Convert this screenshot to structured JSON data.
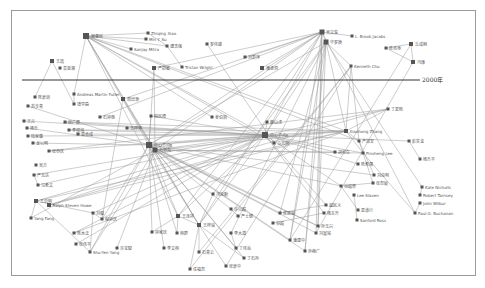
{
  "diagram": {
    "type": "network",
    "timeline_label": "2000年",
    "timeline_y": 80,
    "colors": {
      "node": "#555555",
      "edge": "#9a9a9a",
      "line": "#333333",
      "frame": "#9a9a9a"
    },
    "nodes": [
      {
        "id": "n1",
        "label": "谢惠民",
        "x": 86,
        "y": 36,
        "s": 6
      },
      {
        "id": "n2",
        "label": "Zhiqing Xiao",
        "x": 148,
        "y": 33,
        "s": 3
      },
      {
        "id": "n3",
        "label": "Min Y. Su",
        "x": 146,
        "y": 39,
        "s": 3
      },
      {
        "id": "n4",
        "label": "Sanjay Mitra",
        "x": 131,
        "y": 49,
        "s": 3
      },
      {
        "id": "n5",
        "label": "谭浩强",
        "x": 167,
        "y": 46,
        "s": 3
      },
      {
        "id": "n6",
        "label": "罗伟雄",
        "x": 207,
        "y": 44,
        "s": 3
      },
      {
        "id": "n7",
        "label": "严蔚敏",
        "x": 154,
        "y": 68,
        "s": 4
      },
      {
        "id": "n8",
        "label": "Tristan Wright",
        "x": 182,
        "y": 67,
        "s": 3
      },
      {
        "id": "n9",
        "label": "王选",
        "x": 52,
        "y": 61,
        "s": 4
      },
      {
        "id": "n10",
        "label": "袁亚湘",
        "x": 60,
        "y": 68,
        "s": 3
      },
      {
        "id": "n11",
        "label": "吴文俊",
        "x": 322,
        "y": 32,
        "s": 5
      },
      {
        "id": "n12",
        "label": "L. Brook Jacobs",
        "x": 352,
        "y": 36,
        "s": 3
      },
      {
        "id": "n13",
        "label": "华罗庚",
        "x": 326,
        "y": 42,
        "s": 5
      },
      {
        "id": "n14",
        "label": "刘爱萍",
        "x": 245,
        "y": 57,
        "s": 3
      },
      {
        "id": "n15",
        "label": "潘承洞",
        "x": 262,
        "y": 68,
        "s": 4
      },
      {
        "id": "n16",
        "label": "Kenneth Chu",
        "x": 351,
        "y": 66,
        "s": 3
      },
      {
        "id": "n17",
        "label": "陈省身",
        "x": 386,
        "y": 48,
        "s": 3
      },
      {
        "id": "n18",
        "label": "丘成桐",
        "x": 411,
        "y": 44,
        "s": 4
      },
      {
        "id": "n19",
        "label": "冯康",
        "x": 413,
        "y": 62,
        "s": 4
      },
      {
        "id": "n20",
        "label": "Andreas Martin Fuller",
        "x": 74,
        "y": 94,
        "s": 3
      },
      {
        "id": "n21",
        "label": "陈景润",
        "x": 35,
        "y": 97,
        "s": 3
      },
      {
        "id": "n22",
        "label": "钱学森",
        "x": 74,
        "y": 104,
        "s": 3
      },
      {
        "id": "n23",
        "label": "苏步青",
        "x": 28,
        "y": 106,
        "s": 3
      },
      {
        "id": "n24",
        "label": "周培源",
        "x": 123,
        "y": 99,
        "s": 4
      },
      {
        "id": "n25",
        "label": "王元",
        "x": 24,
        "y": 121,
        "s": 3
      },
      {
        "id": "n26",
        "label": "杨乐",
        "x": 27,
        "y": 128,
        "s": 3
      },
      {
        "id": "n27",
        "label": "张广厚",
        "x": 65,
        "y": 122,
        "s": 3
      },
      {
        "id": "n28",
        "label": "陆家羲",
        "x": 28,
        "y": 136,
        "s": 3
      },
      {
        "id": "n29",
        "label": "李邦河",
        "x": 69,
        "y": 130,
        "s": 3
      },
      {
        "id": "n30",
        "label": "曾肯成",
        "x": 78,
        "y": 134,
        "s": 3
      },
      {
        "id": "n31",
        "label": "龙以明",
        "x": 33,
        "y": 143,
        "s": 3
      },
      {
        "id": "n32",
        "label": "张恭庆",
        "x": 49,
        "y": 151,
        "s": 3
      },
      {
        "id": "n33",
        "label": "石钟慈",
        "x": 100,
        "y": 117,
        "s": 3
      },
      {
        "id": "n34",
        "label": "程民德",
        "x": 151,
        "y": 116,
        "s": 3
      },
      {
        "id": "n35",
        "label": "王梓坤",
        "x": 127,
        "y": 128,
        "s": 3
      },
      {
        "id": "n36",
        "label": "姜伯驹",
        "x": 212,
        "y": 117,
        "s": 3
      },
      {
        "id": "n37",
        "label": "廖山涛",
        "x": 267,
        "y": 122,
        "s": 3
      },
      {
        "id": "n38",
        "label": "中心节点A",
        "x": 265,
        "y": 135,
        "s": 6
      },
      {
        "id": "n39",
        "label": "中心节点B",
        "x": 149,
        "y": 145,
        "s": 6
      },
      {
        "id": "n40",
        "label": "万哲先",
        "x": 155,
        "y": 150,
        "s": 5
      },
      {
        "id": "n41",
        "label": "马志明",
        "x": 274,
        "y": 143,
        "s": 3
      },
      {
        "id": "n42",
        "label": "Xiaohong Zhang",
        "x": 346,
        "y": 131,
        "s": 4
      },
      {
        "id": "n43",
        "label": "丁夏畦",
        "x": 388,
        "y": 109,
        "s": 3
      },
      {
        "id": "n44",
        "label": "严加安",
        "x": 359,
        "y": 141,
        "s": 3
      },
      {
        "id": "n45",
        "label": "胡和生",
        "x": 335,
        "y": 152,
        "s": 3
      },
      {
        "id": "n46",
        "label": "Pinsheng Lee",
        "x": 363,
        "y": 153,
        "s": 3
      },
      {
        "id": "n47",
        "label": "彭实戈",
        "x": 409,
        "y": 141,
        "s": 3
      },
      {
        "id": "n48",
        "label": "杨乐平",
        "x": 420,
        "y": 159,
        "s": 3
      },
      {
        "id": "n49",
        "label": "陈希孺",
        "x": 358,
        "y": 164,
        "s": 3
      },
      {
        "id": "n50",
        "label": "刘应明",
        "x": 374,
        "y": 175,
        "s": 3
      },
      {
        "id": "n51",
        "label": "张尧庭",
        "x": 373,
        "y": 183,
        "s": 3
      },
      {
        "id": "n52",
        "label": "Kate Nicholls",
        "x": 422,
        "y": 187,
        "s": 3
      },
      {
        "id": "n53",
        "label": "Robert Tarnsey",
        "x": 420,
        "y": 195,
        "s": 3
      },
      {
        "id": "n54",
        "label": "John Wilbur",
        "x": 420,
        "y": 203,
        "s": 3
      },
      {
        "id": "n55",
        "label": "Paul G. Buchanan",
        "x": 415,
        "y": 213,
        "s": 3
      },
      {
        "id": "n56",
        "label": "谷超豪",
        "x": 341,
        "y": 186,
        "s": 3
      },
      {
        "id": "n57",
        "label": "Lee Slaven",
        "x": 354,
        "y": 195,
        "s": 3
      },
      {
        "id": "n58",
        "label": "夏道行",
        "x": 358,
        "y": 210,
        "s": 3
      },
      {
        "id": "n59",
        "label": "Sanford Ross",
        "x": 357,
        "y": 220,
        "s": 3
      },
      {
        "id": "n60",
        "label": "越民义",
        "x": 326,
        "y": 205,
        "s": 3
      },
      {
        "id": "n61",
        "label": "杨东升",
        "x": 324,
        "y": 213,
        "s": 3
      },
      {
        "id": "n62",
        "label": "孙玉兴",
        "x": 318,
        "y": 226,
        "s": 3
      },
      {
        "id": "n63",
        "label": "刘宣铭",
        "x": 316,
        "y": 233,
        "s": 3
      },
      {
        "id": "n64",
        "label": "潘建中",
        "x": 290,
        "y": 240,
        "s": 3
      },
      {
        "id": "n65",
        "label": "孙继广",
        "x": 305,
        "y": 251,
        "s": 3
      },
      {
        "id": "n66",
        "label": "侯振挺",
        "x": 280,
        "y": 213,
        "s": 3
      },
      {
        "id": "n67",
        "label": "许以超",
        "x": 231,
        "y": 209,
        "s": 3
      },
      {
        "id": "n68",
        "label": "严士健",
        "x": 238,
        "y": 216,
        "s": 3
      },
      {
        "id": "n69",
        "label": "王梓良",
        "x": 199,
        "y": 225,
        "s": 4
      },
      {
        "id": "n70",
        "label": "冯克勤",
        "x": 213,
        "y": 194,
        "s": 3
      },
      {
        "id": "n71",
        "label": "王连祥",
        "x": 178,
        "y": 216,
        "s": 4
      },
      {
        "id": "n72",
        "label": "林群",
        "x": 177,
        "y": 233,
        "s": 3
      },
      {
        "id": "n73",
        "label": "石青云",
        "x": 199,
        "y": 252,
        "s": 3
      },
      {
        "id": "n74",
        "label": "任福尧",
        "x": 190,
        "y": 269,
        "s": 3
      },
      {
        "id": "n75",
        "label": "李大潜",
        "x": 231,
        "y": 233,
        "s": 3
      },
      {
        "id": "n76",
        "label": "丁伟岳",
        "x": 236,
        "y": 248,
        "s": 3
      },
      {
        "id": "n77",
        "label": "钟家庆",
        "x": 152,
        "y": 232,
        "s": 3
      },
      {
        "id": "n78",
        "label": "Yang Fang",
        "x": 31,
        "y": 218,
        "s": 3
      },
      {
        "id": "n79",
        "label": "Ralph Steven Howe",
        "x": 49,
        "y": 205,
        "s": 4
      },
      {
        "id": "n80",
        "label": "王启明",
        "x": 36,
        "y": 201,
        "s": 4
      },
      {
        "id": "n81",
        "label": "刘徽",
        "x": 93,
        "y": 213,
        "s": 3
      },
      {
        "id": "n82",
        "label": "程崇庆",
        "x": 102,
        "y": 219,
        "s": 3
      },
      {
        "id": "n83",
        "label": "陈木法",
        "x": 74,
        "y": 233,
        "s": 3
      },
      {
        "id": "n84",
        "label": "Shu-Yen Yang",
        "x": 90,
        "y": 252,
        "s": 3
      },
      {
        "id": "n85",
        "label": "张伟平",
        "x": 76,
        "y": 244,
        "s": 3
      },
      {
        "id": "n86",
        "label": "马希文",
        "x": 38,
        "y": 185,
        "s": 3
      },
      {
        "id": "n87",
        "label": "严志达",
        "x": 34,
        "y": 175,
        "s": 3
      },
      {
        "id": "n88",
        "label": "吴方",
        "x": 36,
        "y": 165,
        "s": 3
      },
      {
        "id": "n89",
        "label": "许宝騄",
        "x": 117,
        "y": 248,
        "s": 3
      },
      {
        "id": "n90",
        "label": "李文林",
        "x": 164,
        "y": 248,
        "s": 3
      },
      {
        "id": "n91",
        "label": "张景中",
        "x": 226,
        "y": 266,
        "s": 3
      },
      {
        "id": "n92",
        "label": "丁石孙",
        "x": 244,
        "y": 258,
        "s": 3
      },
      {
        "id": "n93",
        "label": "谷超",
        "x": 273,
        "y": 223,
        "s": 3
      }
    ],
    "edges": [
      [
        "n1",
        "n2"
      ],
      [
        "n1",
        "n3"
      ],
      [
        "n1",
        "n4"
      ],
      [
        "n1",
        "n5"
      ],
      [
        "n1",
        "n38"
      ],
      [
        "n1",
        "n39"
      ],
      [
        "n1",
        "n40"
      ],
      [
        "n1",
        "n42"
      ],
      [
        "n1",
        "n20"
      ],
      [
        "n1",
        "n36"
      ],
      [
        "n1",
        "n41"
      ],
      [
        "n1",
        "n69"
      ],
      [
        "n1",
        "n71"
      ],
      [
        "n1",
        "n44"
      ],
      [
        "n2",
        "n5"
      ],
      [
        "n5",
        "n8"
      ],
      [
        "n6",
        "n41"
      ],
      [
        "n7",
        "n11"
      ],
      [
        "n7",
        "n39"
      ],
      [
        "n7",
        "n40"
      ],
      [
        "n9",
        "n21"
      ],
      [
        "n9",
        "n22"
      ],
      [
        "n11",
        "n12"
      ],
      [
        "n11",
        "n13"
      ],
      [
        "n11",
        "n14"
      ],
      [
        "n11",
        "n38"
      ],
      [
        "n11",
        "n39"
      ],
      [
        "n11",
        "n40"
      ],
      [
        "n11",
        "n71"
      ],
      [
        "n11",
        "n69"
      ],
      [
        "n11",
        "n64"
      ],
      [
        "n11",
        "n63"
      ],
      [
        "n11",
        "n62"
      ],
      [
        "n11",
        "n65"
      ],
      [
        "n11",
        "n55"
      ],
      [
        "n11",
        "n15"
      ],
      [
        "n11",
        "n33"
      ],
      [
        "n11",
        "n24"
      ],
      [
        "n13",
        "n16"
      ],
      [
        "n13",
        "n38"
      ],
      [
        "n13",
        "n39"
      ],
      [
        "n13",
        "n64"
      ],
      [
        "n13",
        "n62"
      ],
      [
        "n13",
        "n65"
      ],
      [
        "n13",
        "n52"
      ],
      [
        "n13",
        "n42"
      ],
      [
        "n13",
        "n70"
      ],
      [
        "n13",
        "n75"
      ],
      [
        "n13",
        "n66"
      ],
      [
        "n16",
        "n42"
      ],
      [
        "n16",
        "n44"
      ],
      [
        "n16",
        "n74"
      ],
      [
        "n16",
        "n73"
      ],
      [
        "n16",
        "n91"
      ],
      [
        "n17",
        "n18"
      ],
      [
        "n17",
        "n19"
      ],
      [
        "n18",
        "n19"
      ],
      [
        "n18",
        "n64"
      ],
      [
        "n19",
        "n63"
      ],
      [
        "n38",
        "n39"
      ],
      [
        "n38",
        "n40"
      ],
      [
        "n38",
        "n42"
      ],
      [
        "n38",
        "n25"
      ],
      [
        "n38",
        "n27"
      ],
      [
        "n38",
        "n28"
      ],
      [
        "n38",
        "n32"
      ],
      [
        "n38",
        "n29"
      ],
      [
        "n38",
        "n30"
      ],
      [
        "n38",
        "n37"
      ],
      [
        "n38",
        "n45"
      ],
      [
        "n38",
        "n46"
      ],
      [
        "n38",
        "n43"
      ],
      [
        "n38",
        "n49"
      ],
      [
        "n38",
        "n56"
      ],
      [
        "n38",
        "n61"
      ],
      [
        "n38",
        "n60"
      ],
      [
        "n38",
        "n80"
      ],
      [
        "n38",
        "n79"
      ],
      [
        "n38",
        "n83"
      ],
      [
        "n38",
        "n85"
      ],
      [
        "n38",
        "n81"
      ],
      [
        "n38",
        "n87"
      ],
      [
        "n38",
        "n86"
      ],
      [
        "n38",
        "n34"
      ],
      [
        "n38",
        "n35"
      ],
      [
        "n38",
        "n47"
      ],
      [
        "n38",
        "n71"
      ],
      [
        "n38",
        "n69"
      ],
      [
        "n39",
        "n40"
      ],
      [
        "n39",
        "n42"
      ],
      [
        "n39",
        "n26"
      ],
      [
        "n39",
        "n23"
      ],
      [
        "n39",
        "n31"
      ],
      [
        "n39",
        "n84"
      ],
      [
        "n39",
        "n82"
      ],
      [
        "n39",
        "n90"
      ],
      [
        "n39",
        "n72"
      ],
      [
        "n39",
        "n77"
      ],
      [
        "n39",
        "n69"
      ],
      [
        "n39",
        "n71"
      ],
      [
        "n39",
        "n62"
      ],
      [
        "n39",
        "n63"
      ],
      [
        "n39",
        "n64"
      ],
      [
        "n39",
        "n66"
      ],
      [
        "n39",
        "n67"
      ],
      [
        "n39",
        "n56"
      ],
      [
        "n39",
        "n50"
      ],
      [
        "n39",
        "n34"
      ],
      [
        "n40",
        "n42"
      ],
      [
        "n40",
        "n46"
      ],
      [
        "n40",
        "n45"
      ],
      [
        "n40",
        "n62"
      ],
      [
        "n40",
        "n65"
      ],
      [
        "n40",
        "n89"
      ],
      [
        "n40",
        "n76"
      ],
      [
        "n40",
        "n92"
      ],
      [
        "n40",
        "n84"
      ],
      [
        "n40",
        "n78"
      ],
      [
        "n42",
        "n46"
      ],
      [
        "n42",
        "n44"
      ],
      [
        "n42",
        "n43"
      ],
      [
        "n42",
        "n27"
      ],
      [
        "n42",
        "n29"
      ],
      [
        "n42",
        "n79"
      ],
      [
        "n42",
        "n83"
      ],
      [
        "n42",
        "n80"
      ],
      [
        "n43",
        "n79"
      ],
      [
        "n43",
        "n32"
      ],
      [
        "n44",
        "n50"
      ],
      [
        "n44",
        "n51"
      ],
      [
        "n46",
        "n55"
      ],
      [
        "n47",
        "n48"
      ],
      [
        "n20",
        "n22"
      ],
      [
        "n24",
        "n82"
      ],
      [
        "n24",
        "n69"
      ],
      [
        "n69",
        "n73"
      ],
      [
        "n69",
        "n74"
      ],
      [
        "n69",
        "n70"
      ],
      [
        "n69",
        "n71"
      ],
      [
        "n69",
        "n92"
      ],
      [
        "n69",
        "n91"
      ],
      [
        "n71",
        "n72"
      ],
      [
        "n71",
        "n77"
      ],
      [
        "n80",
        "n78"
      ],
      [
        "n80",
        "n81"
      ],
      [
        "n81",
        "n82"
      ],
      [
        "n80",
        "n84"
      ],
      [
        "n81",
        "n84"
      ],
      [
        "n86",
        "n87"
      ],
      [
        "n56",
        "n58"
      ],
      [
        "n57",
        "n59"
      ],
      [
        "n51",
        "n56"
      ],
      [
        "n53",
        "n52"
      ],
      [
        "n54",
        "n55"
      ],
      [
        "n60",
        "n66"
      ],
      [
        "n61",
        "n93"
      ],
      [
        "n67",
        "n68"
      ],
      [
        "n75",
        "n76"
      ]
    ]
  }
}
